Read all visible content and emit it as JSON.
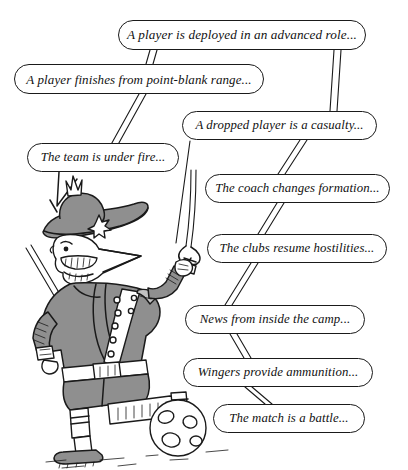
{
  "image": {
    "type": "cartoon-illustration",
    "title": "Football war metaphors cartoon",
    "background_color": "#ffffff",
    "ink_color": "#1a1a1a",
    "fill_gray": "#8f8f8f",
    "fill_gray_light": "#bfbfbf",
    "width": 408,
    "height": 470
  },
  "character": {
    "name": "napoleonic-officer",
    "description": "Cartoon military officer in bicorne hat with large nose and moustache, raising a sabre, holding a musket, one boot resting on a football",
    "props": [
      "bicorne-hat",
      "cockade-star",
      "sabre",
      "musket",
      "sash",
      "belt",
      "football",
      "football-boots"
    ]
  },
  "bubbles": [
    {
      "id": "deployed-advanced-role",
      "text": "A player is deployed in an advanced role...",
      "x": 118,
      "y": 20,
      "w": 248,
      "h": 30,
      "font_size": 13.2
    },
    {
      "id": "point-blank-range",
      "text": "A player finishes from point-blank range...",
      "x": 14,
      "y": 64,
      "w": 250,
      "h": 30,
      "font_size": 13.0
    },
    {
      "id": "dropped-player-casualty",
      "text": "A dropped player is a casualty...",
      "x": 182,
      "y": 111,
      "w": 195,
      "h": 29,
      "font_size": 12.8
    },
    {
      "id": "team-under-fire",
      "text": "The team is under fire...",
      "x": 27,
      "y": 143,
      "w": 152,
      "h": 29,
      "font_size": 12.8
    },
    {
      "id": "coach-changes-formation",
      "text": "The coach changes formation...",
      "x": 205,
      "y": 174,
      "w": 185,
      "h": 29,
      "font_size": 12.8
    },
    {
      "id": "clubs-resume-hostilities",
      "text": "The clubs resume hostilities...",
      "x": 207,
      "y": 234,
      "w": 180,
      "h": 29,
      "font_size": 12.8
    },
    {
      "id": "news-inside-camp",
      "text": "News from inside the camp...",
      "x": 185,
      "y": 305,
      "w": 180,
      "h": 29,
      "font_size": 12.8
    },
    {
      "id": "wingers-provide-ammo",
      "text": "Wingers provide ammunition...",
      "x": 183,
      "y": 358,
      "w": 190,
      "h": 29,
      "font_size": 12.8
    },
    {
      "id": "match-is-a-battle",
      "text": "The match is a battle...",
      "x": 213,
      "y": 404,
      "w": 152,
      "h": 29,
      "font_size": 12.8
    }
  ]
}
